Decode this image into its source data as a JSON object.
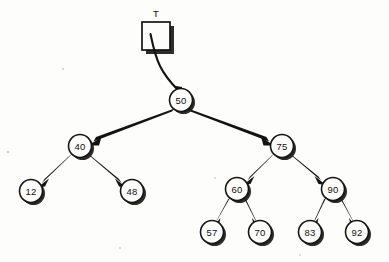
{
  "diagram": {
    "background_color": "#fdfdfc",
    "ink_color": "#131313",
    "pointer": {
      "label": "T",
      "box": {
        "x": 142,
        "y": 22,
        "width": 28,
        "height": 28
      },
      "target": "50"
    },
    "node_radius": 11.5,
    "nodes": [
      {
        "id": "n50",
        "label": "50",
        "x": 181,
        "y": 100,
        "level": 0
      },
      {
        "id": "n40",
        "label": "40",
        "x": 80,
        "y": 146,
        "level": 1
      },
      {
        "id": "n75",
        "label": "75",
        "x": 282,
        "y": 146,
        "level": 1
      },
      {
        "id": "n12",
        "label": "12",
        "x": 31,
        "y": 191,
        "level": 2
      },
      {
        "id": "n48",
        "label": "48",
        "x": 132,
        "y": 191,
        "level": 2
      },
      {
        "id": "n60",
        "label": "60",
        "x": 237,
        "y": 189,
        "level": 2
      },
      {
        "id": "n90",
        "label": "90",
        "x": 333,
        "y": 189,
        "level": 2
      },
      {
        "id": "n57",
        "label": "57",
        "x": 212,
        "y": 232,
        "level": 3
      },
      {
        "id": "n70",
        "label": "70",
        "x": 260,
        "y": 232,
        "level": 3
      },
      {
        "id": "n83",
        "label": "83",
        "x": 310,
        "y": 232,
        "level": 3
      },
      {
        "id": "n92",
        "label": "92",
        "x": 357,
        "y": 232,
        "level": 3
      }
    ],
    "edges": [
      {
        "from": "n50",
        "to": "n40",
        "side": "left"
      },
      {
        "from": "n50",
        "to": "n75",
        "side": "right"
      },
      {
        "from": "n40",
        "to": "n12",
        "side": "left"
      },
      {
        "from": "n40",
        "to": "n48",
        "side": "right"
      },
      {
        "from": "n75",
        "to": "n60",
        "side": "left"
      },
      {
        "from": "n75",
        "to": "n90",
        "side": "right"
      },
      {
        "from": "n60",
        "to": "n57",
        "side": "left"
      },
      {
        "from": "n60",
        "to": "n70",
        "side": "right"
      },
      {
        "from": "n90",
        "to": "n83",
        "side": "left"
      },
      {
        "from": "n90",
        "to": "n92",
        "side": "right"
      }
    ]
  }
}
